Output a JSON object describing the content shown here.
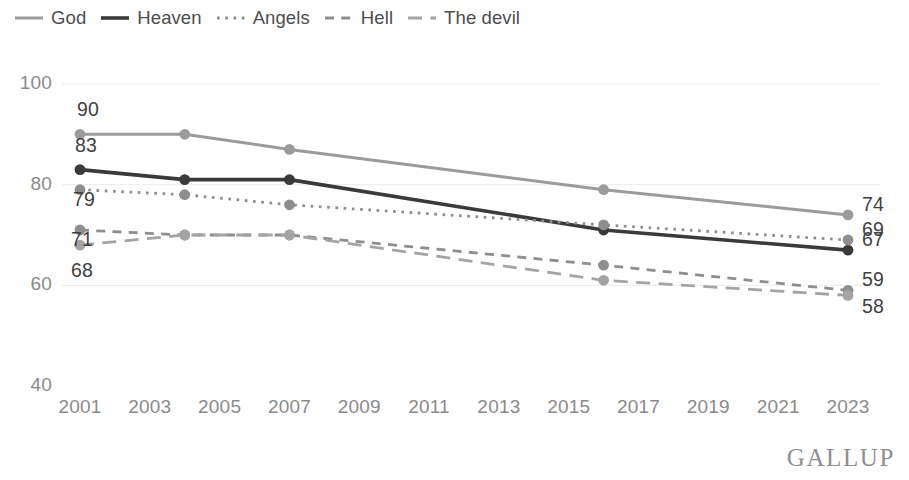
{
  "legend": {
    "items": [
      {
        "label": "God",
        "key": "god",
        "style": "solid",
        "color": "#9b9b9b",
        "width": 3.0
      },
      {
        "label": "Heaven",
        "key": "heaven",
        "style": "solid",
        "color": "#3a3a3a",
        "width": 3.6
      },
      {
        "label": "Angels",
        "key": "angels",
        "style": "dotted",
        "color": "#8e8e8e",
        "width": 2.8
      },
      {
        "label": "Hell",
        "key": "hell",
        "style": "dashed",
        "color": "#8e8e8e",
        "width": 2.8
      },
      {
        "label": "The devil",
        "key": "devil",
        "style": "longdash",
        "color": "#a4a4a4",
        "width": 2.8
      }
    ]
  },
  "axes": {
    "y_ticks": [
      "100",
      "80",
      "60",
      "40"
    ],
    "x_ticks": [
      "2001",
      "2003",
      "2005",
      "2007",
      "2009",
      "2011",
      "2013",
      "2015",
      "2017",
      "2019",
      "2021",
      "2023"
    ]
  },
  "labels": {
    "left": [
      "90",
      "83",
      "79",
      "71",
      "68"
    ],
    "right": [
      "74",
      "69",
      "67",
      "59",
      "58"
    ]
  },
  "branding": {
    "logo": "GALLUP"
  },
  "colors": {
    "god": "#9b9b9b",
    "heaven": "#3a3a3a",
    "angels": "#8e8e8e",
    "hell": "#8e8e8e",
    "devil": "#a4a4a4",
    "grid": "#ebebeb",
    "tick_text": "#8a8a8a",
    "label_text": "#3f3f3f"
  },
  "chart_data": {
    "type": "line",
    "title": "",
    "subtitle": "",
    "xlabel": "",
    "ylabel": "",
    "x": [
      2001,
      2004,
      2007,
      2016,
      2023
    ],
    "xlim": [
      2000,
      2024
    ],
    "ylim": [
      40,
      100
    ],
    "y_ticks": [
      40,
      60,
      80,
      100
    ],
    "x_ticks": [
      2001,
      2003,
      2005,
      2007,
      2009,
      2011,
      2013,
      2015,
      2017,
      2019,
      2021,
      2023
    ],
    "grid": "horizontal",
    "legend_position": "top-left",
    "series": [
      {
        "name": "God",
        "values": [
          90,
          90,
          87,
          79,
          74
        ],
        "color": "#9b9b9b",
        "dash": "solid",
        "start_label": "90",
        "end_label": "74"
      },
      {
        "name": "Heaven",
        "values": [
          83,
          81,
          81,
          71,
          67
        ],
        "color": "#3a3a3a",
        "dash": "solid",
        "start_label": "83",
        "end_label": "67"
      },
      {
        "name": "Angels",
        "values": [
          79,
          78,
          76,
          72,
          69
        ],
        "color": "#8e8e8e",
        "dash": "dotted",
        "start_label": "79",
        "end_label": "69"
      },
      {
        "name": "Hell",
        "values": [
          71,
          70,
          70,
          64,
          59
        ],
        "color": "#8e8e8e",
        "dash": "dashed",
        "start_label": "71",
        "end_label": "59"
      },
      {
        "name": "The devil",
        "values": [
          68,
          70,
          70,
          61,
          58
        ],
        "color": "#a4a4a4",
        "dash": "longdash",
        "start_label": "68",
        "end_label": "58"
      }
    ]
  }
}
